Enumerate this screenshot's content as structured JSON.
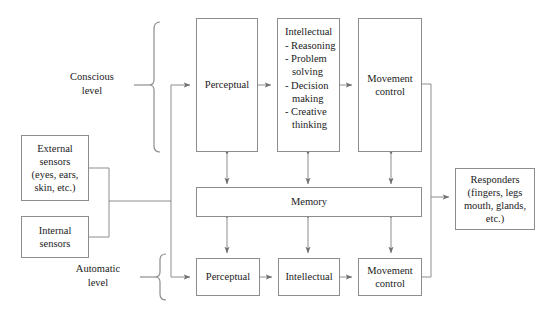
{
  "diagram": {
    "stroke_color": "#8d8d8d",
    "text_color": "#1b1b1b",
    "background": "#ffffff",
    "levels": [
      {
        "name": "conscious-level",
        "label": "Conscious\nlevel",
        "label_line1": "Conscious",
        "label_line2": "level"
      },
      {
        "name": "automatic-level",
        "label": "Automatic\nlevel",
        "label_line1": "Automatic",
        "label_line2": "level"
      }
    ],
    "sensors": [
      {
        "name": "external-sensors",
        "line1": "External",
        "line2": "sensors",
        "line3": "(eyes, ears,",
        "line4": "skin, etc.)"
      },
      {
        "name": "internal-sensors",
        "line1": "Internal",
        "line2": "sensors"
      }
    ],
    "conscious_row": {
      "perceptual": {
        "label": "Perceptual"
      },
      "intellectual": {
        "title": "Intellectual",
        "items": [
          "- Reasoning",
          "- Problem",
          "solving",
          "- Decision",
          "making",
          "- Creative",
          "thinking"
        ]
      },
      "movement_control": {
        "line1": "Movement",
        "line2": "control"
      }
    },
    "memory": {
      "label": "Memory"
    },
    "automatic_row": {
      "perceptual": {
        "label": "Perceptual"
      },
      "intellectual": {
        "label": "Intellectual"
      },
      "movement_control": {
        "line1": "Movement",
        "line2": "control"
      }
    },
    "responders": {
      "line1": "Responders",
      "line2": "(fingers, legs",
      "line3": "mouth, glands,",
      "line4": "etc.)"
    }
  }
}
